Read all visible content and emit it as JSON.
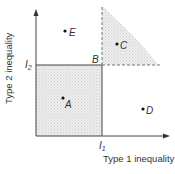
{
  "diagram": {
    "axes": {
      "x_label": "Type 1 inequality",
      "y_label": "Type 2 inequality",
      "x_threshold_label": "I",
      "x_threshold_sub": "1",
      "y_threshold_label": "I",
      "y_threshold_sub": "2"
    },
    "corner_label": "B",
    "points": [
      {
        "id": "A",
        "label": "A",
        "region": "shaded square (below both thresholds)"
      },
      {
        "id": "C",
        "label": "C",
        "region": "shaded curved region (above both thresholds)"
      },
      {
        "id": "D",
        "label": "D",
        "region": "right of I1, below I2"
      },
      {
        "id": "E",
        "label": "E",
        "region": "left of I1, above I2"
      }
    ],
    "colors": {
      "axis": "#444444",
      "shade": "#e6e6e6",
      "dashed": "#777777"
    }
  }
}
